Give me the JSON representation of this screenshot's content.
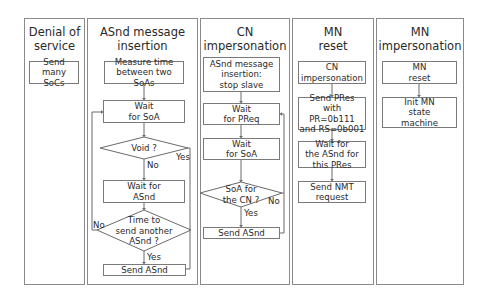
{
  "columns": [
    {
      "title_line1": "Denial of",
      "title_line2": "service",
      "steps": [
        {
          "line1": "Send many",
          "line2": "SoCs"
        }
      ]
    },
    {
      "title_line1": "ASnd message",
      "title_line2": "insertion",
      "steps": [
        {
          "line1": "Measure time",
          "line2": "between two SoAs"
        },
        {
          "line1": "Wait",
          "line2": "for SoA"
        },
        {
          "decision": "Void ?",
          "yes": "Yes",
          "no": "No"
        },
        {
          "line1": "Wait for",
          "line2": "ASnd"
        },
        {
          "decision_line1": "Time to",
          "decision_line2": "send another",
          "decision_line3": "ASnd ?",
          "yes": "Yes",
          "no": "No"
        },
        {
          "line1": "Send ASnd"
        }
      ]
    },
    {
      "title_line1": "CN",
      "title_line2": "impersonation",
      "steps": [
        {
          "line1": "ASnd message",
          "line2": "insertion:",
          "line3": "stop slave"
        },
        {
          "line1": "Wait",
          "line2": "for PReq"
        },
        {
          "line1": "Wait",
          "line2": "for SoA"
        },
        {
          "decision_line1": "SoA for",
          "decision_line2": "the CN ?",
          "yes": "Yes",
          "no": "No"
        },
        {
          "line1": "Send ASnd"
        }
      ]
    },
    {
      "title_line1": "MN",
      "title_line2": "reset",
      "steps": [
        {
          "line1": "CN",
          "line2": "impersonation"
        },
        {
          "line1": "Send PRes",
          "line2": "with PR=0b111",
          "line3": "and RS=0b001"
        },
        {
          "line1": "Wait for",
          "line2": "the ASnd for",
          "line3": "this PRes"
        },
        {
          "line1": "Send NMT",
          "line2": "request"
        }
      ]
    },
    {
      "title_line1": "MN",
      "title_line2": "impersonation",
      "steps": [
        {
          "line1": "MN",
          "line2": "reset"
        },
        {
          "line1": "Init MN",
          "line2": "state",
          "line3": "machine"
        }
      ]
    }
  ],
  "colors": {
    "border": "#8a8a8a",
    "line": "#6a6a6a",
    "text": "#2a2a2a",
    "background": "#ffffff"
  }
}
